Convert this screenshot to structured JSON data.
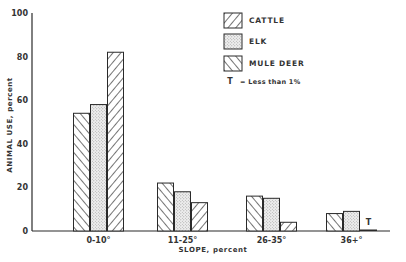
{
  "chart_data": {
    "type": "bar",
    "title": "",
    "xlabel": "SLOPE, percent",
    "ylabel": "ANIMAL USE, percent",
    "ylim": [
      0,
      100
    ],
    "yticks": [
      0,
      20,
      40,
      60,
      80,
      100
    ],
    "grid": false,
    "legend_position": "top-right",
    "categories": [
      "0-10°",
      "11-25°",
      "26-35°",
      "36+°"
    ],
    "series": [
      {
        "name": "CATTLE",
        "pattern": "hatch-backslash",
        "values": [
          54,
          22,
          16,
          8
        ]
      },
      {
        "name": "ELK",
        "pattern": "stipple",
        "values": [
          58,
          18,
          15,
          9
        ]
      },
      {
        "name": "MULE DEER",
        "pattern": "hatch-forward",
        "values": [
          82,
          13,
          4,
          0.5
        ]
      }
    ],
    "annotations": [
      {
        "text": "T",
        "category": "36+°",
        "series": "MULE DEER",
        "meaning": "Less than 1%"
      }
    ],
    "legend_note": "T = Less than 1%"
  },
  "labels": {
    "ylabel": "ANIMAL USE, percent",
    "xlabel": "SLOPE, percent",
    "note_symbol": "T",
    "note_text": "= Less than 1%",
    "trace_marker": "T"
  },
  "colors": {
    "ink": "#2a2a2a",
    "background": "#ffffff",
    "stipple": "#9a9a9a"
  }
}
